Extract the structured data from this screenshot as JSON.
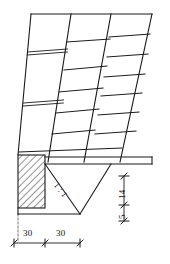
{
  "drawing": {
    "type": "engineering-section-drawing",
    "subject": "battered masonry retaining wall with concrete footing and base slab",
    "line_color": "#1a1a1a",
    "hatch_color": "#2b2b2b",
    "background": "#ffffff"
  },
  "dimensions": {
    "horizontal": [
      {
        "id": "dim-30-left",
        "value": "30"
      },
      {
        "id": "dim-30-right",
        "value": "30"
      }
    ],
    "vertical": [
      {
        "id": "dim-14",
        "value": "14"
      },
      {
        "id": "dim-5",
        "value": "5"
      }
    ]
  },
  "annotations": {
    "slope_label": "1 : 1"
  }
}
